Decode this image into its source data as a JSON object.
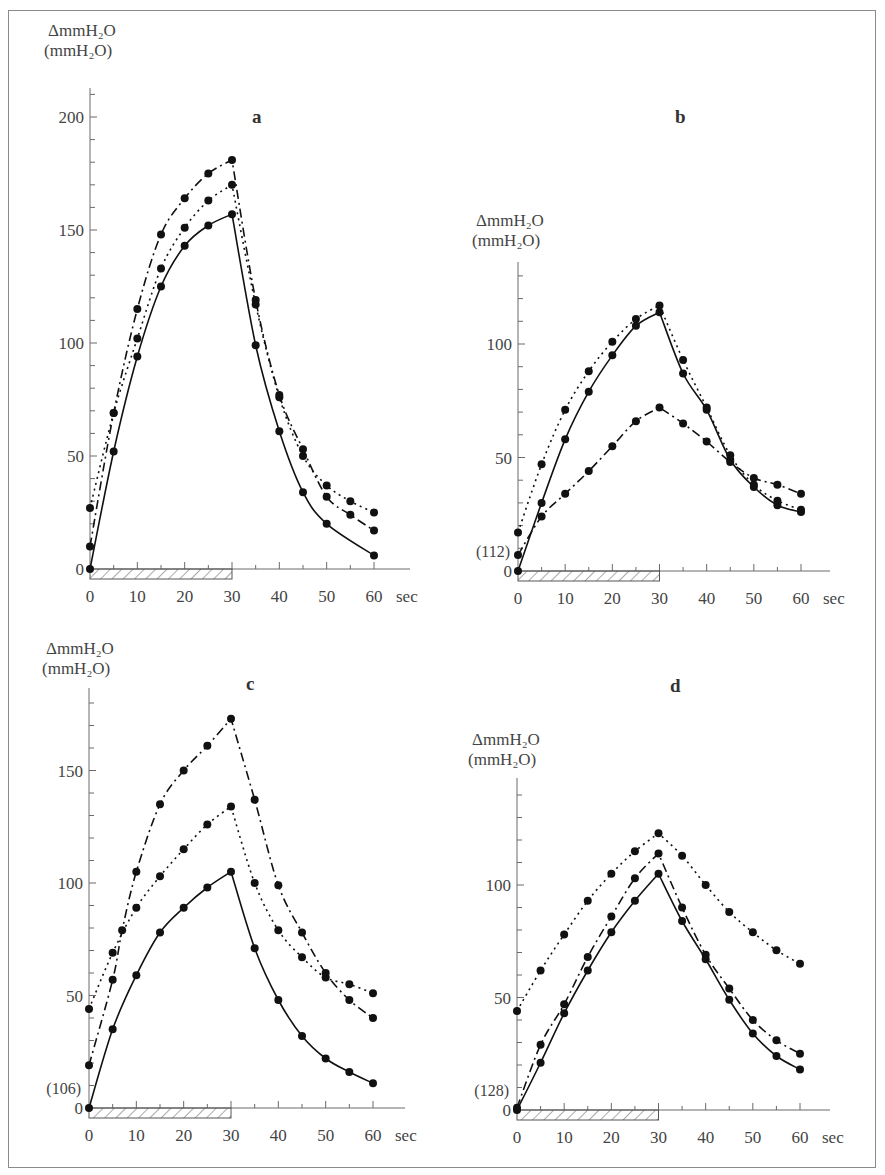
{
  "figure": {
    "y_label_line1": "ΔmmH₂O",
    "y_label_line2": "(mmH₂O)",
    "x_unit": "sec",
    "stimulus_bar": {
      "from": 0,
      "to": 30
    },
    "series_styles": {
      "solid": "solid line",
      "dotted": "dotted line",
      "dashdot": "dash-dot line"
    }
  },
  "chart_data": [
    {
      "panel": "a",
      "type": "line",
      "title": "a",
      "xlabel": "sec",
      "ylabel": "ΔmmH₂O (mmH₂O)",
      "baseline_label": "",
      "x_ticks": [
        0,
        10,
        20,
        30,
        40,
        50,
        60
      ],
      "y_ticks": [
        0,
        50,
        100,
        150,
        200
      ],
      "xlim": [
        0,
        60
      ],
      "ylim": [
        0,
        210
      ],
      "grid": false,
      "legend": "none",
      "series": [
        {
          "name": "solid",
          "style": "solid",
          "x": [
            0,
            5,
            10,
            15,
            20,
            25,
            30,
            35,
            40,
            45,
            50,
            60
          ],
          "values": [
            0,
            52,
            94,
            125,
            143,
            152,
            157,
            99,
            61,
            34,
            20,
            6
          ]
        },
        {
          "name": "dotted",
          "style": "dotted",
          "x": [
            0,
            5,
            10,
            15,
            20,
            25,
            30,
            35,
            40,
            45,
            50,
            55,
            60
          ],
          "values": [
            27,
            69,
            102,
            133,
            151,
            163,
            170,
            117,
            76,
            50,
            37,
            30,
            25
          ]
        },
        {
          "name": "dash-dot",
          "style": "dashdot",
          "x": [
            0,
            5,
            10,
            15,
            20,
            25,
            30,
            35,
            40,
            45,
            50,
            55,
            60
          ],
          "values": [
            10,
            69,
            115,
            148,
            164,
            175,
            181,
            119,
            77,
            53,
            32,
            24,
            17
          ]
        }
      ]
    },
    {
      "panel": "b",
      "type": "line",
      "title": "b",
      "xlabel": "sec",
      "ylabel": "ΔmmH₂O (mmH₂O)",
      "baseline_label": "(112)",
      "x_ticks": [
        0,
        10,
        20,
        30,
        40,
        50,
        60
      ],
      "y_ticks": [
        0,
        50,
        100
      ],
      "xlim": [
        0,
        60
      ],
      "ylim": [
        0,
        135
      ],
      "grid": false,
      "legend": "none",
      "series": [
        {
          "name": "solid",
          "style": "solid",
          "x": [
            0,
            5,
            10,
            15,
            20,
            25,
            30,
            35,
            40,
            45,
            50,
            55,
            60
          ],
          "values": [
            0,
            30,
            58,
            79,
            95,
            108,
            114,
            87,
            71,
            49,
            37,
            29,
            26
          ]
        },
        {
          "name": "dotted",
          "style": "dotted",
          "x": [
            0,
            5,
            10,
            15,
            20,
            25,
            30,
            35,
            40,
            45,
            50,
            55,
            60
          ],
          "values": [
            17,
            47,
            71,
            88,
            101,
            111,
            117,
            93,
            72,
            51,
            38,
            31,
            27
          ]
        },
        {
          "name": "dash-dot",
          "style": "dashdot",
          "x": [
            0,
            5,
            10,
            15,
            20,
            25,
            30,
            35,
            40,
            45,
            50,
            55,
            60
          ],
          "values": [
            7,
            24,
            34,
            44,
            55,
            66,
            72,
            65,
            57,
            48,
            41,
            38,
            34
          ]
        }
      ]
    },
    {
      "panel": "c",
      "type": "line",
      "title": "c",
      "xlabel": "sec",
      "ylabel": "ΔmmH₂O (mmH₂O)",
      "baseline_label": "(106)",
      "x_ticks": [
        0,
        10,
        20,
        30,
        40,
        50,
        60
      ],
      "y_ticks": [
        0,
        50,
        100,
        150
      ],
      "xlim": [
        0,
        60
      ],
      "ylim": [
        0,
        185
      ],
      "grid": false,
      "legend": "none",
      "series": [
        {
          "name": "solid",
          "style": "solid",
          "x": [
            0,
            5,
            10,
            15,
            20,
            25,
            30,
            35,
            40,
            45,
            50,
            55,
            60
          ],
          "values": [
            0,
            35,
            59,
            78,
            89,
            98,
            105,
            71,
            48,
            32,
            22,
            16,
            11
          ]
        },
        {
          "name": "dotted",
          "style": "dotted",
          "x": [
            0,
            5,
            10,
            15,
            20,
            25,
            30,
            35,
            40,
            45,
            50,
            55,
            60
          ],
          "values": [
            44,
            69,
            89,
            103,
            115,
            126,
            134,
            100,
            79,
            67,
            58,
            55,
            51
          ]
        },
        {
          "name": "dash-dot",
          "style": "dashdot",
          "x": [
            0,
            5,
            7,
            10,
            15,
            20,
            25,
            30,
            35,
            40,
            45,
            50,
            55,
            60
          ],
          "values": [
            19,
            57,
            79,
            105,
            135,
            150,
            161,
            173,
            137,
            99,
            78,
            60,
            48,
            40
          ]
        }
      ]
    },
    {
      "panel": "d",
      "type": "line",
      "title": "d",
      "xlabel": "sec",
      "ylabel": "ΔmmH₂O (mmH₂O)",
      "baseline_label": "(128)",
      "x_ticks": [
        0,
        10,
        20,
        30,
        40,
        50,
        60
      ],
      "y_ticks": [
        0,
        50,
        100
      ],
      "xlim": [
        0,
        60
      ],
      "ylim": [
        0,
        145
      ],
      "grid": false,
      "legend": "none",
      "series": [
        {
          "name": "solid",
          "style": "solid",
          "x": [
            0,
            5,
            10,
            15,
            20,
            25,
            30,
            35,
            40,
            45,
            50,
            55,
            60
          ],
          "values": [
            0,
            21,
            43,
            62,
            79,
            93,
            105,
            84,
            67,
            49,
            34,
            24,
            18
          ]
        },
        {
          "name": "dotted",
          "style": "dotted",
          "x": [
            0,
            5,
            10,
            15,
            20,
            25,
            30,
            35,
            40,
            45,
            50,
            55,
            60
          ],
          "values": [
            44,
            62,
            78,
            93,
            105,
            115,
            123,
            113,
            100,
            88,
            79,
            71,
            65
          ]
        },
        {
          "name": "dash-dot",
          "style": "dashdot",
          "x": [
            0,
            5,
            10,
            15,
            20,
            25,
            30,
            35,
            40,
            45,
            50,
            55,
            60
          ],
          "values": [
            1,
            29,
            47,
            68,
            86,
            103,
            114,
            90,
            69,
            54,
            40,
            31,
            25
          ]
        }
      ]
    }
  ],
  "layout": {
    "panels": [
      {
        "id": "a",
        "x0": 90,
        "x60": 374,
        "y0": 569,
        "ytop": 88,
        "ppu": 2.26,
        "ylabel_x": 48,
        "ylabel_y": 22,
        "letter_x": 252,
        "letter_y": 123,
        "minor_y_step": 10,
        "axis_right": 410
      },
      {
        "id": "b",
        "x0": 518,
        "x60": 801,
        "y0": 571,
        "ytop": 262,
        "ppu": 2.27,
        "ylabel_x": 476,
        "ylabel_y": 212,
        "letter_x": 675,
        "letter_y": 123,
        "minor_y_step": 10,
        "axis_right": 830
      },
      {
        "id": "c",
        "x0": 89,
        "x60": 373,
        "y0": 1108,
        "ytop": 688,
        "ppu": 2.25,
        "ylabel_x": 46,
        "ylabel_y": 640,
        "letter_x": 246,
        "letter_y": 690,
        "minor_y_step": 10,
        "axis_right": 405
      },
      {
        "id": "d",
        "x0": 517,
        "x60": 800,
        "y0": 1110,
        "ytop": 778,
        "ppu": 2.25,
        "ylabel_x": 472,
        "ylabel_y": 731,
        "letter_x": 670,
        "letter_y": 692,
        "minor_y_step": 10,
        "axis_right": 830
      }
    ]
  }
}
